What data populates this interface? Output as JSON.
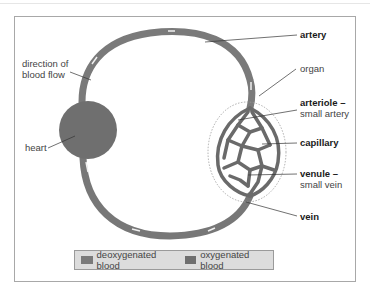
{
  "diagram": {
    "colors": {
      "deoxygenated": "#7a7a7a",
      "oxygenated": "#6e6e6e",
      "heart": "#6f6f6f",
      "organ_outline": "#999999",
      "leader": "#333333"
    },
    "labels": {
      "direction_line1": "direction of",
      "direction_line2": "blood flow",
      "heart": "heart",
      "artery": "artery",
      "organ": "organ",
      "arteriole": "arteriole –",
      "arteriole_sub": "small artery",
      "capillary": "capillary",
      "venule": "venule –",
      "venule_sub": "small vein",
      "vein": "vein"
    },
    "legend": [
      {
        "label": "deoxygenated blood",
        "color": "#7a7a7a"
      },
      {
        "label": "oxygenated blood",
        "color": "#6e6e6e"
      }
    ]
  }
}
